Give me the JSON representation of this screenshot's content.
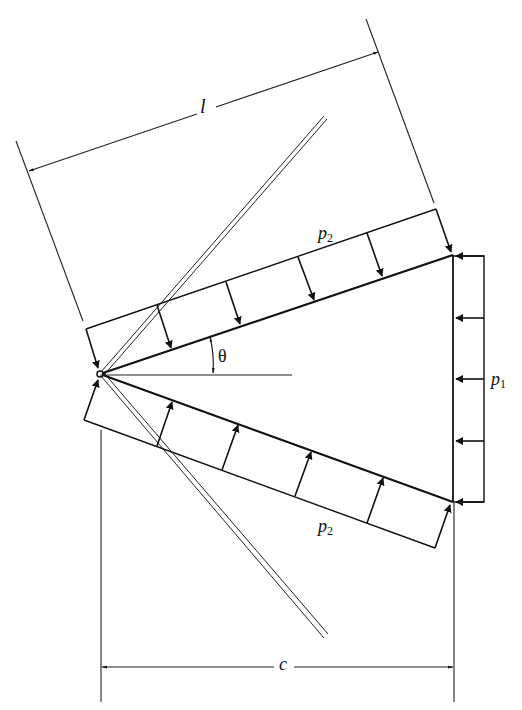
{
  "diagram": {
    "type": "wedge-loading-diagram",
    "labels": {
      "length": "l",
      "chord": "c",
      "angle": "θ",
      "side_pressure_top": {
        "base": "p",
        "sub": "2"
      },
      "side_pressure_bottom": {
        "base": "p",
        "sub": "2"
      },
      "base_pressure": {
        "base": "p",
        "sub": "1"
      }
    },
    "colors": {
      "line": "#111111",
      "background": "#ffffff"
    }
  }
}
